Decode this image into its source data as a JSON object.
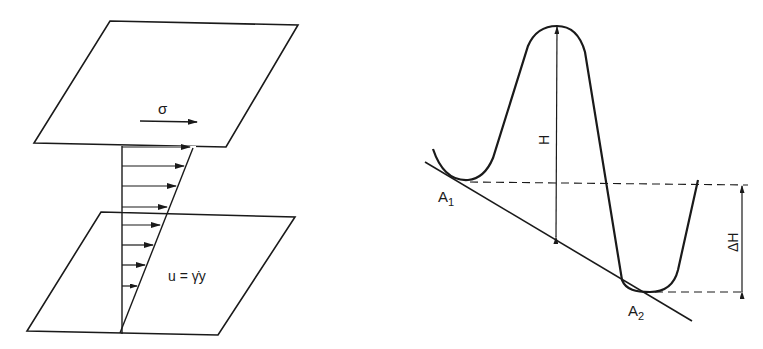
{
  "left_diagram": {
    "title": "Simple shear flow between parallel plates",
    "stress_label": "σ",
    "velocity_equation": "u = γ̇y",
    "velocity_arrow_count": 8
  },
  "right_diagram": {
    "title": "Energy landscape with two minima",
    "barrier_label": "H",
    "energy_difference_label": "ΔH",
    "state1_label": "A",
    "state1_sub": "1",
    "state2_label": "A",
    "state2_sub": "2"
  },
  "colors": {
    "line": "#1a1a1a",
    "background": "#ffffff"
  }
}
